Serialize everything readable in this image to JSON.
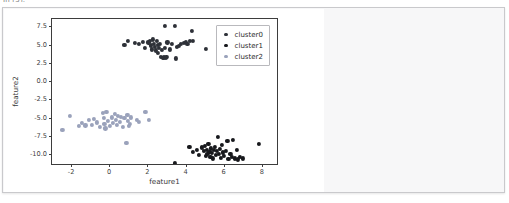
{
  "top_cut_text": "In [5]:",
  "panel": {
    "name": "plot-output-panel",
    "background": "#f7f7f8",
    "border_color": "#c9c9cc"
  },
  "chart_data": {
    "type": "scatter",
    "title": "",
    "xlabel": "feature1",
    "ylabel": "feature2",
    "xlim": [
      -3.0,
      8.9
    ],
    "ylim": [
      -11.6,
      8.5
    ],
    "xticks": [
      -2,
      0,
      2,
      4,
      6,
      8
    ],
    "xtick_labels": [
      "-2",
      "0",
      "2",
      "4",
      "6",
      "8"
    ],
    "yticks": [
      7.5,
      5.0,
      2.5,
      0.0,
      -2.5,
      -5.0,
      -7.5,
      -10.0
    ],
    "ytick_labels": [
      "7.5",
      "5.0",
      "2.5",
      "0.0",
      "-2.5",
      "-5.0",
      "-7.5",
      "-10.0"
    ],
    "grid": false,
    "legend_position": "upper right",
    "series": [
      {
        "name": "cluster0",
        "color": "#2e3138",
        "points": [
          [
            0.8,
            4.95
          ],
          [
            1.0,
            5.45
          ],
          [
            1.35,
            5.25
          ],
          [
            1.55,
            5.05
          ],
          [
            1.75,
            5.35
          ],
          [
            1.85,
            4.55
          ],
          [
            2.05,
            5.3
          ],
          [
            2.15,
            5.55
          ],
          [
            2.2,
            4.9
          ],
          [
            2.25,
            4.35
          ],
          [
            2.3,
            5.7
          ],
          [
            2.35,
            5.1
          ],
          [
            2.4,
            4.7
          ],
          [
            2.45,
            4.2
          ],
          [
            2.5,
            5.45
          ],
          [
            2.55,
            4.95
          ],
          [
            2.55,
            3.85
          ],
          [
            2.6,
            4.55
          ],
          [
            2.65,
            5.15
          ],
          [
            2.7,
            3.35
          ],
          [
            2.75,
            4.3
          ],
          [
            2.8,
            3.2
          ],
          [
            2.85,
            3.25
          ],
          [
            2.9,
            7.55
          ],
          [
            2.9,
            4.6
          ],
          [
            2.95,
            3.15
          ],
          [
            3.0,
            3.3
          ],
          [
            3.05,
            5.3
          ],
          [
            3.2,
            4.35
          ],
          [
            3.3,
            5.05
          ],
          [
            3.45,
            7.55
          ],
          [
            3.5,
            3.1
          ],
          [
            3.55,
            4.7
          ],
          [
            3.65,
            4.8
          ],
          [
            3.75,
            5.1
          ],
          [
            3.9,
            5.25
          ],
          [
            4.0,
            5.4
          ],
          [
            4.1,
            5.05
          ],
          [
            4.25,
            5.5
          ],
          [
            4.35,
            6.85
          ],
          [
            4.4,
            5.55
          ],
          [
            5.05,
            4.45
          ]
        ]
      },
      {
        "name": "cluster1",
        "color": "#17181c",
        "points": [
          [
            3.45,
            -11.15
          ],
          [
            4.2,
            -9.0
          ],
          [
            4.4,
            -9.7
          ],
          [
            4.6,
            -9.35
          ],
          [
            4.7,
            -10.1
          ],
          [
            4.85,
            -9.05
          ],
          [
            4.95,
            -9.55
          ],
          [
            5.0,
            -8.85
          ],
          [
            5.05,
            -10.2
          ],
          [
            5.1,
            -9.4
          ],
          [
            5.15,
            -9.95
          ],
          [
            5.2,
            -8.6
          ],
          [
            5.25,
            -9.65
          ],
          [
            5.3,
            -10.35
          ],
          [
            5.35,
            -9.2
          ],
          [
            5.4,
            -9.8
          ],
          [
            5.45,
            -10.55
          ],
          [
            5.5,
            -9.45
          ],
          [
            5.55,
            -8.95
          ],
          [
            5.6,
            -10.05
          ],
          [
            5.65,
            -9.55
          ],
          [
            5.7,
            -7.65
          ],
          [
            5.75,
            -9.9
          ],
          [
            5.8,
            -9.3
          ],
          [
            5.85,
            -10.45
          ],
          [
            5.9,
            -8.7
          ],
          [
            5.95,
            -9.75
          ],
          [
            6.0,
            -10.2
          ],
          [
            6.1,
            -9.5
          ],
          [
            6.2,
            -8.15
          ],
          [
            6.25,
            -10.6
          ],
          [
            6.35,
            -9.95
          ],
          [
            6.45,
            -10.35
          ],
          [
            6.5,
            -8.05
          ],
          [
            6.6,
            -10.55
          ],
          [
            6.7,
            -9.45
          ],
          [
            6.75,
            -10.7
          ],
          [
            6.85,
            -10.35
          ],
          [
            7.0,
            -10.55
          ],
          [
            7.85,
            -8.55
          ]
        ]
      },
      {
        "name": "cluster2",
        "color": "#9aa2bb",
        "points": [
          [
            -2.45,
            -6.65
          ],
          [
            -2.05,
            -4.8
          ],
          [
            -1.6,
            -6.1
          ],
          [
            -1.45,
            -5.7
          ],
          [
            -1.25,
            -6.05
          ],
          [
            -1.05,
            -5.35
          ],
          [
            -0.9,
            -5.95
          ],
          [
            -0.8,
            -5.15
          ],
          [
            -0.65,
            -5.65
          ],
          [
            -0.5,
            -6.3
          ],
          [
            -0.35,
            -4.35
          ],
          [
            -0.3,
            -5.05
          ],
          [
            -0.25,
            -5.8
          ],
          [
            -0.2,
            -6.45
          ],
          [
            -0.15,
            -4.25
          ],
          [
            -0.05,
            -5.45
          ],
          [
            0.05,
            -6.1
          ],
          [
            0.15,
            -4.95
          ],
          [
            0.2,
            -5.7
          ],
          [
            0.3,
            -4.45
          ],
          [
            0.35,
            -5.25
          ],
          [
            0.4,
            -6.0
          ],
          [
            0.45,
            -4.7
          ],
          [
            0.55,
            -5.55
          ],
          [
            0.6,
            -4.9
          ],
          [
            0.7,
            -6.2
          ],
          [
            0.8,
            -5.05
          ],
          [
            0.9,
            -8.45
          ],
          [
            0.95,
            -4.6
          ],
          [
            1.0,
            -5.45
          ],
          [
            1.05,
            -6.15
          ],
          [
            1.1,
            -5.85
          ],
          [
            1.15,
            -4.95
          ],
          [
            1.45,
            -5.25
          ],
          [
            1.55,
            -5.6
          ],
          [
            1.9,
            -4.15
          ],
          [
            2.1,
            -5.25
          ]
        ]
      }
    ]
  },
  "legend": {
    "items": [
      {
        "label": "cluster0",
        "color": "#2e3138"
      },
      {
        "label": "cluster1",
        "color": "#17181c"
      },
      {
        "label": "cluster2",
        "color": "#9aa2bb"
      }
    ]
  }
}
